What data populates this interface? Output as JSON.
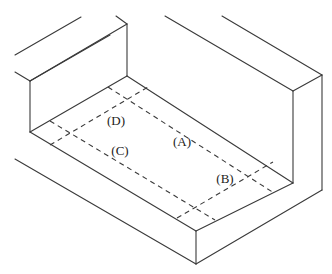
{
  "figure": {
    "labels": [
      {
        "id": "A",
        "text": "(A)",
        "x": 182,
        "y": 142
      },
      {
        "id": "B",
        "text": "(B)",
        "x": 225,
        "y": 179
      },
      {
        "id": "C",
        "text": "(C)",
        "x": 120,
        "y": 151
      },
      {
        "id": "D",
        "text": "(D)",
        "x": 116,
        "y": 121
      }
    ],
    "colors": {
      "line": "#3a3a3a",
      "background": "#ffffff"
    }
  }
}
